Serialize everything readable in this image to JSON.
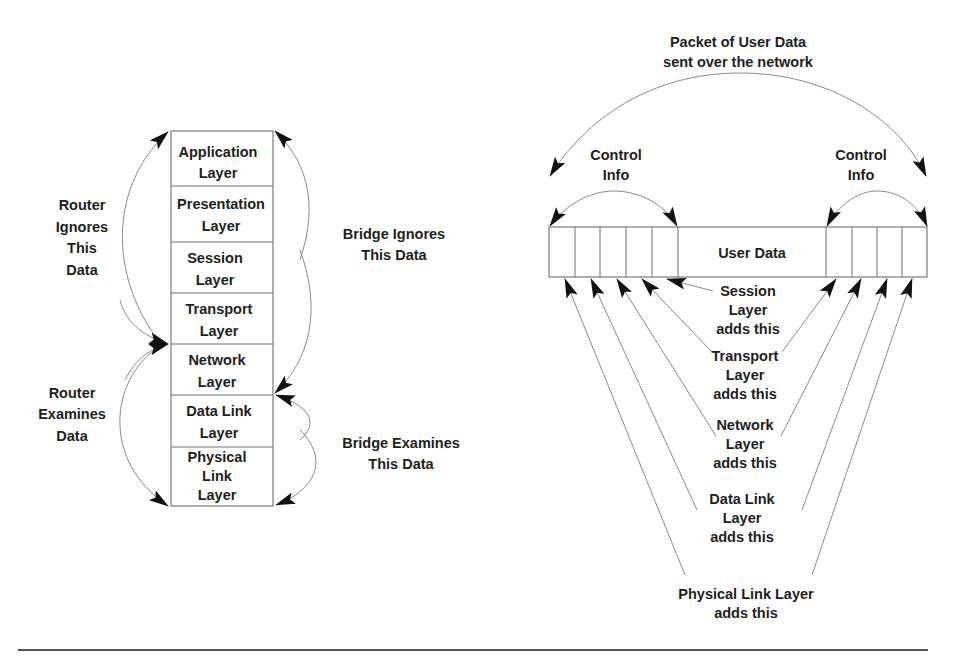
{
  "osi_stack": {
    "layers": [
      {
        "line1": "Application",
        "line2": "Layer"
      },
      {
        "line1": "Presentation",
        "line2": "Layer"
      },
      {
        "line1": "Session",
        "line2": "Layer"
      },
      {
        "line1": "Transport",
        "line2": "Layer"
      },
      {
        "line1": "Network",
        "line2": "Layer"
      },
      {
        "line1": "Data Link",
        "line2": "Layer"
      },
      {
        "line1": "Physical",
        "line2": "Link",
        "line3": "Layer"
      }
    ]
  },
  "annotations": {
    "router_ignores": [
      "Router",
      "Ignores",
      "This",
      "Data"
    ],
    "router_examines": [
      "Router",
      "Examines",
      "Data"
    ],
    "bridge_ignores": [
      "Bridge Ignores",
      "This Data"
    ],
    "bridge_examines": [
      "Bridge Examines",
      "This Data"
    ]
  },
  "packet": {
    "title": [
      "Packet of User Data",
      "sent over the network"
    ],
    "control_left": [
      "Control",
      "Info"
    ],
    "control_right": [
      "Control",
      "Info"
    ],
    "user_data": "User Data",
    "left_header_cells": 5,
    "right_trailer_cells": 4
  },
  "layer_additions": {
    "session": [
      "Session",
      "Layer",
      "adds this"
    ],
    "transport": [
      "Transport",
      "Layer",
      "adds this"
    ],
    "network": [
      "Network",
      "Layer",
      "adds this"
    ],
    "data_link": [
      "Data Link",
      "Layer",
      "adds this"
    ],
    "physical": [
      "Physical Link Layer",
      "adds this"
    ]
  },
  "colors": {
    "text": "#1e1e1e",
    "line": "#8a8a8a",
    "arrowhead": "#111111",
    "background": "#ffffff"
  }
}
